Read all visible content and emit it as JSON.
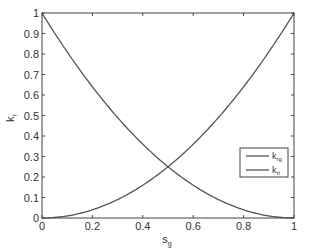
{
  "chart_data": {
    "type": "line",
    "title": "",
    "xlabel": "s_g",
    "ylabel": "k_r",
    "xlim": [
      0,
      1
    ],
    "ylim": [
      0,
      1
    ],
    "grid": false,
    "legend_position": "lower right (inside, around y=0.2-0.35)",
    "xticks": [
      "0",
      "0.2",
      "0.4",
      "0.6",
      "0.8",
      "1"
    ],
    "yticks": [
      "0",
      "0.1",
      "0.2",
      "0.3",
      "0.4",
      "0.5",
      "0.6",
      "0.7",
      "0.8",
      "0.9",
      "1"
    ],
    "x": [
      0,
      0.1,
      0.2,
      0.3,
      0.4,
      0.5,
      0.6,
      0.7,
      0.8,
      0.9,
      1.0
    ],
    "series": [
      {
        "name": "k_rg",
        "label_main": "k",
        "label_sub": "rg",
        "values": [
          0,
          0.01,
          0.04,
          0.09,
          0.16,
          0.25,
          0.36,
          0.49,
          0.64,
          0.81,
          1.0
        ]
      },
      {
        "name": "k_rl",
        "label_main": "k",
        "label_sub": "rl",
        "values": [
          1.0,
          0.81,
          0.64,
          0.49,
          0.36,
          0.25,
          0.16,
          0.09,
          0.04,
          0.01,
          0
        ]
      }
    ],
    "intersection": {
      "x": 0.5,
      "y": 0.25
    }
  },
  "axes": {
    "xlabel_main": "s",
    "xlabel_sub": "g",
    "ylabel_main": "k",
    "ylabel_sub": "r"
  },
  "colors": {
    "line": "#555555",
    "axis": "#444444"
  }
}
